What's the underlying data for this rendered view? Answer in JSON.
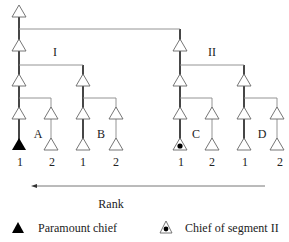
{
  "diagram": {
    "segments": [
      {
        "label": "I",
        "lineages": [
          {
            "label": "A",
            "members": [
              "1",
              "2"
            ]
          },
          {
            "label": "B",
            "members": [
              "1",
              "2"
            ]
          }
        ]
      },
      {
        "label": "II",
        "lineages": [
          {
            "label": "C",
            "members": [
              "1",
              "2"
            ]
          },
          {
            "label": "D",
            "members": [
              "1",
              "2"
            ]
          }
        ]
      }
    ],
    "axis": {
      "label": "Rank",
      "direction": "right-to-left"
    },
    "legend": [
      {
        "symbol": "filled-triangle",
        "label": "Paramount chief"
      },
      {
        "symbol": "triangle-with-dot",
        "label": "Chief of segment II"
      }
    ],
    "colors": {
      "line": "#333333",
      "thin_line": "#888888",
      "triangle_fill": "#ffffff",
      "chief_fill": "#000000"
    }
  }
}
